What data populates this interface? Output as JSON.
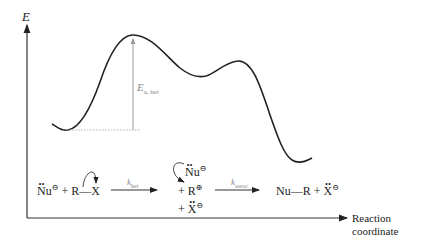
{
  "diagram": {
    "type": "reaction-energy-profile",
    "y_axis_label": "E",
    "x_axis_label_line1": "Reaction",
    "x_axis_label_line2": "coordinate",
    "activation_label_main": "E",
    "activation_label_sub": "a, het",
    "reaction": {
      "reactant_nu": "Nu",
      "reactant_charge": "⊖",
      "plus1": "+",
      "reactant_r": "R",
      "bond": "—",
      "reactant_x": "X",
      "step1_rate_main": "k",
      "step1_rate_sub": "het",
      "intermediate_nu": "Nu",
      "intermediate_nu_charge": "⊖",
      "intermediate_r_prefix": "+ R",
      "intermediate_r_charge": "⊕",
      "intermediate_x_prefix": "+ ",
      "intermediate_x": "X",
      "intermediate_x_charge": "⊖",
      "step2_rate_main": "k",
      "step2_rate_sub": "assoc",
      "product": "Nu—R",
      "plus2": "+",
      "product_x": "X",
      "product_x_charge": "⊖"
    },
    "colors": {
      "curve": "#222222",
      "axis": "#333333",
      "activation_arrow": "#999999"
    }
  }
}
